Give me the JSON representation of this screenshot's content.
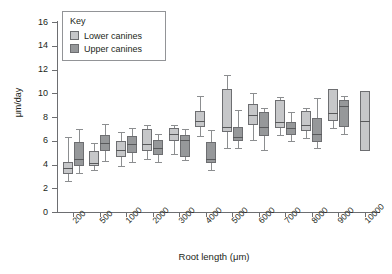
{
  "chart_data": {
    "type": "box",
    "title": "",
    "xlabel": "Root length (μm)",
    "ylabel": "μm/day",
    "ylim": [
      0,
      16
    ],
    "yticks": [
      0,
      2,
      4,
      6,
      8,
      10,
      12,
      14,
      16
    ],
    "grid": false,
    "legend": {
      "title": "Key",
      "position": "top-left",
      "entries": [
        {
          "label": "Lower canines",
          "color": "#c6c7c9"
        },
        {
          "label": "Upper canines",
          "color": "#96989a"
        }
      ]
    },
    "categories": [
      "200",
      "500",
      "1000",
      "2000",
      "3000",
      "4000",
      "5000",
      "6000",
      "7000",
      "8000",
      "9000",
      "10000"
    ],
    "series": [
      {
        "name": "Lower canines",
        "color": "#c6c7c9",
        "boxes": [
          {
            "category": "200",
            "whisker_low": 2.6,
            "q1": 3.2,
            "median": 3.7,
            "q3": 4.2,
            "whisker_high": 6.3
          },
          {
            "category": "500",
            "whisker_low": 3.5,
            "q1": 3.9,
            "median": 4.1,
            "q3": 5.1,
            "whisker_high": 5.8
          },
          {
            "category": "1000",
            "whisker_low": 3.9,
            "q1": 4.6,
            "median": 5.2,
            "q3": 6.0,
            "whisker_high": 6.7
          },
          {
            "category": "2000",
            "whisker_low": 4.5,
            "q1": 5.1,
            "median": 5.7,
            "q3": 7.0,
            "whisker_high": 7.3
          },
          {
            "category": "3000",
            "whisker_low": 4.9,
            "q1": 6.0,
            "median": 6.6,
            "q3": 7.1,
            "whisker_high": 7.3
          },
          {
            "category": "4000",
            "whisker_low": 6.4,
            "q1": 7.2,
            "median": 7.7,
            "q3": 8.5,
            "whisker_high": 9.8
          },
          {
            "category": "5000",
            "whisker_low": 5.4,
            "q1": 6.7,
            "median": 7.2,
            "q3": 10.4,
            "whisker_high": 11.5
          },
          {
            "category": "6000",
            "whisker_low": 6.1,
            "q1": 7.3,
            "median": 8.2,
            "q3": 9.1,
            "whisker_high": 10.0
          },
          {
            "category": "7000",
            "whisker_low": 6.5,
            "q1": 7.1,
            "median": 7.6,
            "q3": 9.4,
            "whisker_high": 9.7
          },
          {
            "category": "8000",
            "whisker_low": 6.2,
            "q1": 6.8,
            "median": 7.3,
            "q3": 8.5,
            "whisker_high": 8.8
          },
          {
            "category": "9000",
            "whisker_low": 7.1,
            "q1": 7.7,
            "median": 8.3,
            "q3": 10.4,
            "whisker_high": 10.4
          },
          {
            "category": "10000",
            "whisker_low": 5.1,
            "q1": 5.1,
            "median": 7.7,
            "q3": 10.2,
            "whisker_high": 10.2
          }
        ]
      },
      {
        "name": "Upper canines",
        "color": "#96989a",
        "boxes": [
          {
            "category": "200",
            "whisker_low": 3.3,
            "q1": 3.9,
            "median": 4.5,
            "q3": 5.9,
            "whisker_high": 7.0
          },
          {
            "category": "500",
            "whisker_low": 4.3,
            "q1": 5.1,
            "median": 5.8,
            "q3": 6.5,
            "whisker_high": 7.4
          },
          {
            "category": "1000",
            "whisker_low": 4.2,
            "q1": 5.0,
            "median": 5.7,
            "q3": 6.4,
            "whisker_high": 7.1
          },
          {
            "category": "2000",
            "whisker_low": 4.2,
            "q1": 4.8,
            "median": 5.4,
            "q3": 6.1,
            "whisker_high": 6.6
          },
          {
            "category": "3000",
            "whisker_low": 4.4,
            "q1": 4.6,
            "median": 6.1,
            "q3": 6.5,
            "whisker_high": 7.0
          },
          {
            "category": "4000",
            "whisker_low": 3.5,
            "q1": 4.1,
            "median": 4.5,
            "q3": 5.9,
            "whisker_high": 6.9
          },
          {
            "category": "5000",
            "whisker_low": 5.4,
            "q1": 6.0,
            "median": 6.3,
            "q3": 7.2,
            "whisker_high": 8.6
          },
          {
            "category": "6000",
            "whisker_low": 5.2,
            "q1": 6.4,
            "median": 7.2,
            "q3": 8.4,
            "whisker_high": 8.8
          },
          {
            "category": "7000",
            "whisker_low": 6.0,
            "q1": 6.5,
            "median": 7.1,
            "q3": 7.6,
            "whisker_high": 8.4
          },
          {
            "category": "8000",
            "whisker_low": 5.4,
            "q1": 5.9,
            "median": 6.6,
            "q3": 7.9,
            "whisker_high": 9.6
          },
          {
            "category": "9000",
            "whisker_low": 6.6,
            "q1": 7.2,
            "median": 8.9,
            "q3": 9.4,
            "whisker_high": 9.8
          }
        ]
      }
    ]
  }
}
